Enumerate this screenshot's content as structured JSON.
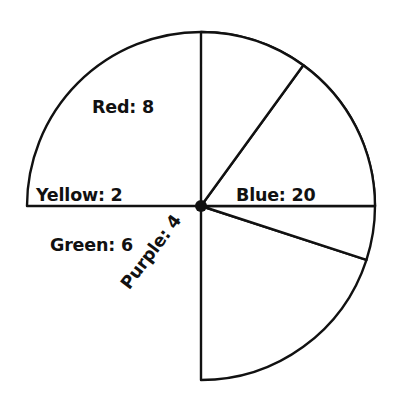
{
  "chart_data": {
    "type": "pie",
    "title": "",
    "subtitle": "",
    "xlabel": "",
    "ylabel": "",
    "legend_position": "none",
    "grid": false,
    "total": 40,
    "categories": [
      "Blue",
      "Red",
      "Yellow",
      "Green",
      "Purple"
    ],
    "values": [
      20,
      8,
      2,
      6,
      4
    ],
    "slices": [
      {
        "name": "Blue",
        "value": 20,
        "label": "Blue: 20",
        "percent": 50,
        "angle_degrees": 180,
        "start_angle_degrees": 0,
        "end_angle_degrees": 180,
        "fill": "#ffffff",
        "stroke": "#111111"
      },
      {
        "name": "Red",
        "value": 8,
        "label": "Red: 8",
        "percent": 20,
        "angle_degrees": 72,
        "start_angle_degrees": 270,
        "end_angle_degrees": 342,
        "fill": "#ffffff",
        "stroke": "#111111"
      },
      {
        "name": "Yellow",
        "value": 2,
        "label": "Yellow: 2",
        "percent": 5,
        "angle_degrees": 18,
        "start_angle_degrees": 342,
        "end_angle_degrees": 360,
        "fill": "#ffffff",
        "stroke": "#111111"
      },
      {
        "name": "Green",
        "value": 6,
        "label": "Green: 6",
        "percent": 15,
        "angle_degrees": 54,
        "start_angle_degrees": 0,
        "end_angle_degrees": 54,
        "fill": "#ffffff",
        "stroke": "#111111"
      },
      {
        "name": "Purple",
        "value": 4,
        "label": "Purple: 4",
        "percent": 10,
        "angle_degrees": 36,
        "start_angle_degrees": 54,
        "end_angle_degrees": 90,
        "fill": "#ffffff",
        "stroke": "#111111"
      }
    ],
    "geometry": {
      "center_x": 201,
      "center_y": 206,
      "radius": 174,
      "center_dot_radius": 6
    },
    "style": {
      "background": "#ffffff",
      "outline_color": "#111111",
      "text_color": "#111111"
    }
  }
}
